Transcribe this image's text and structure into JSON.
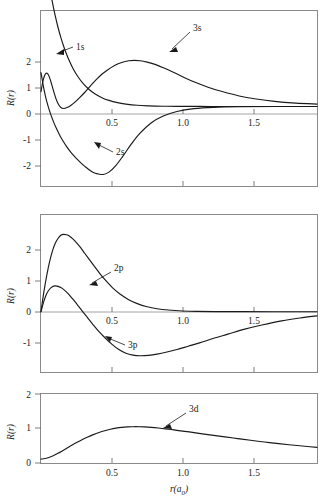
{
  "figure": {
    "axis_titles": {
      "y": "R(r)",
      "x_main": "r",
      "x_paren_open": "(",
      "x_symbol": "a",
      "x_subscript": "0",
      "x_paren_close": ")"
    }
  },
  "chart_data": [
    {
      "type": "line",
      "panel_id": "panel-s",
      "title": "",
      "xlabel": "",
      "ylabel": "R(r)",
      "xlim": [
        0,
        1.95
      ],
      "ylim": [
        -2.35,
        2.85
      ],
      "xticks": [
        0.5,
        1.0,
        1.5
      ],
      "xticklabels": [
        "0.5",
        "1.0",
        "1.5"
      ],
      "yticks": [
        -2,
        -1,
        0,
        1,
        2
      ],
      "yticklabels": [
        "-2",
        "-1",
        "0",
        "1",
        "2"
      ],
      "grid": false,
      "legend": "inline-annotations",
      "annotations": [
        {
          "label": "1s",
          "x": 0.145,
          "y": 1.52
        },
        {
          "label": "3s",
          "x": 0.8,
          "y": 2.08
        },
        {
          "label": "2s",
          "x": 0.385,
          "y": -1.14
        }
      ],
      "series": [
        {
          "name": "1s",
          "x": [
            0.0,
            0.02,
            0.04,
            0.06,
            0.08,
            0.1,
            0.12,
            0.14,
            0.16,
            0.18,
            0.2,
            0.23,
            0.26,
            0.3,
            0.34,
            0.38,
            0.43,
            0.48,
            0.54,
            0.6,
            0.68,
            0.76,
            0.86,
            0.96,
            1.08,
            1.2,
            1.35,
            1.5,
            1.7,
            1.95
          ],
          "y": [
            5.4,
            4.69,
            4.08,
            3.55,
            3.09,
            2.69,
            2.34,
            2.04,
            1.78,
            1.55,
            1.35,
            1.09,
            0.885,
            0.665,
            0.5,
            0.375,
            0.259,
            0.179,
            0.113,
            0.071,
            0.035,
            0.018,
            0.007,
            0.003,
            0.001,
            0.0,
            0.0,
            0.0,
            0.0,
            0.0
          ]
        },
        {
          "name": "2s",
          "x": [
            0.0,
            0.015,
            0.03,
            0.05,
            0.07,
            0.09,
            0.11,
            0.135,
            0.16,
            0.185,
            0.21,
            0.235,
            0.26,
            0.285,
            0.31,
            0.34,
            0.37,
            0.4,
            0.44,
            0.48,
            0.53,
            0.58,
            0.64,
            0.7,
            0.78,
            0.86,
            0.96,
            1.08,
            1.22,
            1.4,
            1.65,
            1.95
          ],
          "y": [
            1.0,
            0.64,
            0.33,
            0.01,
            -0.25,
            -0.47,
            -0.66,
            -0.87,
            -1.05,
            -1.21,
            -1.35,
            -1.47,
            -1.58,
            -1.68,
            -1.77,
            -1.87,
            -1.95,
            -1.99,
            -2.01,
            -1.94,
            -1.74,
            -1.46,
            -1.1,
            -0.79,
            -0.48,
            -0.29,
            -0.15,
            -0.065,
            -0.025,
            -0.008,
            -0.002,
            0.0
          ]
        },
        {
          "name": "3s",
          "x": [
            0.0,
            0.012,
            0.024,
            0.036,
            0.048,
            0.06,
            0.075,
            0.09,
            0.105,
            0.12,
            0.14,
            0.16,
            0.185,
            0.21,
            0.24,
            0.275,
            0.31,
            0.35,
            0.39,
            0.43,
            0.47,
            0.52,
            0.57,
            0.62,
            0.66,
            0.7,
            0.75,
            0.8,
            0.86,
            0.92,
            1.0,
            1.08,
            1.18,
            1.28,
            1.4,
            1.52,
            1.65,
            1.8,
            1.95
          ],
          "y": [
            0.44,
            0.72,
            0.9,
            0.98,
            0.96,
            0.86,
            0.66,
            0.44,
            0.24,
            0.09,
            -0.03,
            -0.06,
            -0.03,
            0.03,
            0.13,
            0.27,
            0.42,
            0.61,
            0.79,
            0.95,
            1.08,
            1.21,
            1.3,
            1.35,
            1.36,
            1.35,
            1.31,
            1.25,
            1.15,
            1.04,
            0.88,
            0.73,
            0.57,
            0.44,
            0.31,
            0.22,
            0.15,
            0.1,
            0.07
          ]
        }
      ]
    },
    {
      "type": "line",
      "panel_id": "panel-p",
      "title": "",
      "xlabel": "",
      "ylabel": "R(r)",
      "xlim": [
        0,
        1.95
      ],
      "ylim": [
        -1.45,
        2.35
      ],
      "xticks": [
        0.5,
        1.0,
        1.5
      ],
      "xticklabels": [
        "0.5",
        "1.0",
        "1.5"
      ],
      "yticks": [
        -1,
        0,
        1,
        2
      ],
      "yticklabels": [
        "-1",
        "0",
        "1",
        "2"
      ],
      "grid": false,
      "legend": "inline-annotations",
      "annotations": [
        {
          "label": "2p",
          "x": 0.515,
          "y": 1.3
        },
        {
          "label": "3p",
          "x": 0.585,
          "y": -0.6
        }
      ],
      "series": [
        {
          "name": "2p",
          "x": [
            0.0,
            0.02,
            0.04,
            0.06,
            0.08,
            0.1,
            0.12,
            0.14,
            0.16,
            0.18,
            0.2,
            0.225,
            0.25,
            0.28,
            0.31,
            0.345,
            0.38,
            0.42,
            0.46,
            0.51,
            0.56,
            0.62,
            0.68,
            0.75,
            0.82,
            0.9,
            1.0,
            1.1,
            1.25,
            1.42,
            1.65,
            1.95
          ],
          "y": [
            0.0,
            0.47,
            0.86,
            1.19,
            1.45,
            1.64,
            1.76,
            1.84,
            1.86,
            1.85,
            1.82,
            1.75,
            1.66,
            1.54,
            1.4,
            1.24,
            1.08,
            0.9,
            0.74,
            0.56,
            0.42,
            0.29,
            0.195,
            0.12,
            0.072,
            0.04,
            0.018,
            0.008,
            0.003,
            0.001,
            0.0,
            0.0
          ]
        },
        {
          "name": "3p",
          "x": [
            0.0,
            0.02,
            0.04,
            0.06,
            0.08,
            0.1,
            0.12,
            0.14,
            0.165,
            0.19,
            0.215,
            0.24,
            0.27,
            0.3,
            0.335,
            0.37,
            0.41,
            0.45,
            0.5,
            0.55,
            0.6,
            0.65,
            0.7,
            0.76,
            0.82,
            0.89,
            0.96,
            1.04,
            1.12,
            1.22,
            1.32,
            1.44,
            1.56,
            1.7,
            1.83,
            1.95
          ],
          "y": [
            0.0,
            0.25,
            0.43,
            0.54,
            0.6,
            0.62,
            0.61,
            0.58,
            0.52,
            0.44,
            0.34,
            0.24,
            0.11,
            -0.02,
            -0.17,
            -0.32,
            -0.48,
            -0.62,
            -0.78,
            -0.91,
            -1.0,
            -1.045,
            -1.06,
            -1.05,
            -1.02,
            -0.97,
            -0.91,
            -0.83,
            -0.75,
            -0.64,
            -0.54,
            -0.42,
            -0.32,
            -0.22,
            -0.15,
            -0.1
          ]
        }
      ]
    },
    {
      "type": "line",
      "panel_id": "panel-d",
      "title": "",
      "xlabel": "r(a0)",
      "ylabel": "R(r)",
      "xlim": [
        0,
        1.95
      ],
      "ylim": [
        -0.12,
        2.05
      ],
      "xticks": [
        0.5,
        1.0,
        1.5
      ],
      "xticklabels": [
        "0.5",
        "1.0",
        "1.5"
      ],
      "yticks": [
        0,
        1,
        2
      ],
      "yticklabels": [
        "0",
        "1",
        "2"
      ],
      "grid": false,
      "legend": "inline-annotations",
      "annotations": [
        {
          "label": "3d",
          "x": 0.985,
          "y": 1.42
        }
      ],
      "series": [
        {
          "name": "3d",
          "x": [
            0.0,
            0.03,
            0.06,
            0.09,
            0.12,
            0.15,
            0.185,
            0.22,
            0.255,
            0.29,
            0.33,
            0.37,
            0.41,
            0.45,
            0.49,
            0.53,
            0.57,
            0.61,
            0.65,
            0.69,
            0.73,
            0.78,
            0.83,
            0.88,
            0.94,
            1.0,
            1.07,
            1.14,
            1.22,
            1.3,
            1.39,
            1.48,
            1.58,
            1.68,
            1.79,
            1.9,
            1.95
          ],
          "y": [
            0.0,
            0.02,
            0.06,
            0.115,
            0.18,
            0.255,
            0.345,
            0.435,
            0.52,
            0.6,
            0.685,
            0.76,
            0.825,
            0.88,
            0.925,
            0.96,
            0.985,
            1.0,
            1.005,
            1.005,
            0.998,
            0.985,
            0.965,
            0.94,
            0.905,
            0.87,
            0.83,
            0.785,
            0.735,
            0.69,
            0.635,
            0.585,
            0.53,
            0.48,
            0.43,
            0.385,
            0.365
          ]
        }
      ]
    }
  ]
}
